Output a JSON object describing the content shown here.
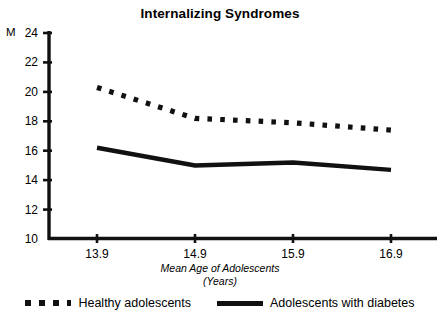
{
  "chart_data": {
    "type": "line",
    "title": "Internalizing Syndromes",
    "xlabel": "Mean Age of Adolescents",
    "xlabel_line2": "(Years)",
    "ylabel": "M",
    "x": [
      13.9,
      14.9,
      15.9,
      16.9
    ],
    "categories": [
      "13.9",
      "14.9",
      "15.9",
      "16.9"
    ],
    "xtick_labels": [
      "13.9",
      "14.9",
      "15.9",
      "16.9"
    ],
    "ytick_labels": [
      "24",
      "22",
      "20",
      "18",
      "16",
      "14",
      "12",
      "10"
    ],
    "ylim": [
      10,
      24
    ],
    "ytick_step": 2,
    "grid": false,
    "legend_position": "bottom",
    "series": [
      {
        "name": "Healthy adolescents",
        "style": "dotted",
        "color": "#111111",
        "values": [
          20.3,
          18.2,
          17.9,
          17.4
        ]
      },
      {
        "name": "Adolescents with diabetes",
        "style": "solid",
        "color": "#111111",
        "values": [
          16.2,
          15.0,
          15.2,
          14.7
        ]
      }
    ]
  },
  "legend": {
    "entries": [
      {
        "label": "Healthy adolescents"
      },
      {
        "label": "Adolescents with diabetes"
      }
    ]
  },
  "colors": {
    "axis": "#111111",
    "background": "#ffffff",
    "series": "#111111"
  }
}
